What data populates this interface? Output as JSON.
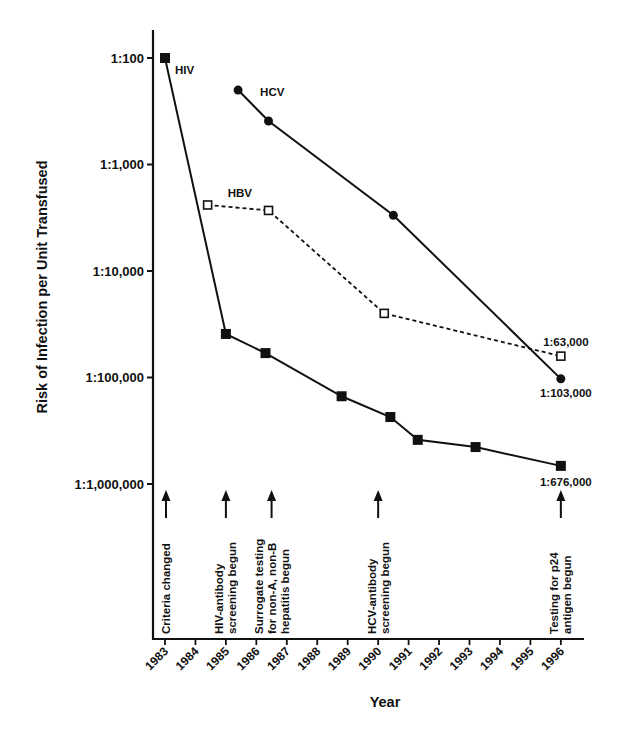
{
  "chart_data": {
    "type": "line",
    "title": "",
    "xlabel": "Year",
    "ylabel": "Risk of Infection per Unit Transfused",
    "yscale": "log",
    "ylim_denominators": [
      100,
      1000000
    ],
    "y_ticks": [
      {
        "denominator": 100,
        "label": "1:100"
      },
      {
        "denominator": 1000,
        "label": "1:1,000"
      },
      {
        "denominator": 10000,
        "label": "1:10,000"
      },
      {
        "denominator": 100000,
        "label": "1:100,000"
      },
      {
        "denominator": 1000000,
        "label": "1:1,000,000"
      }
    ],
    "x_ticks": [
      "1983",
      "1984",
      "1985",
      "1986",
      "1987",
      "1988",
      "1989",
      "1990",
      "1991",
      "1992",
      "1993",
      "1994",
      "1995",
      "1996"
    ],
    "xlim": [
      1983,
      1996
    ],
    "grid": false,
    "legend": "inline series labels",
    "series": [
      {
        "name": "HIV",
        "marker": "filled-square",
        "line": "solid",
        "points": [
          {
            "x": 1983,
            "risk_denominator": 100
          },
          {
            "x": 1985,
            "risk_denominator": 39000
          },
          {
            "x": 1986.3,
            "risk_denominator": 59000
          },
          {
            "x": 1988.8,
            "risk_denominator": 150000
          },
          {
            "x": 1990.4,
            "risk_denominator": 235000
          },
          {
            "x": 1991.3,
            "risk_denominator": 385000
          },
          {
            "x": 1993.2,
            "risk_denominator": 450000
          },
          {
            "x": 1996,
            "risk_denominator": 676000
          }
        ],
        "end_label": "1:676,000"
      },
      {
        "name": "HCV",
        "marker": "filled-circle",
        "line": "solid",
        "points": [
          {
            "x": 1985.4,
            "risk_denominator": 200
          },
          {
            "x": 1986.4,
            "risk_denominator": 390
          },
          {
            "x": 1990.5,
            "risk_denominator": 3000
          },
          {
            "x": 1996,
            "risk_denominator": 103000
          }
        ],
        "end_label": "1:103,000"
      },
      {
        "name": "HBV",
        "marker": "open-square",
        "line": "dashed",
        "points": [
          {
            "x": 1984.4,
            "risk_denominator": 2400
          },
          {
            "x": 1986.4,
            "risk_denominator": 2700
          },
          {
            "x": 1990.2,
            "risk_denominator": 25000
          },
          {
            "x": 1996,
            "risk_denominator": 63000
          }
        ],
        "end_label": "1:63,000"
      }
    ],
    "annotations": [
      {
        "x": 1983,
        "text": [
          "Criteria changed"
        ]
      },
      {
        "x": 1985,
        "text": [
          "HIV-antibody",
          "screening begun"
        ]
      },
      {
        "x": 1986.5,
        "text": [
          "Surrogate testing",
          "for non-A, non-B",
          "hepatitis begun"
        ]
      },
      {
        "x": 1990,
        "text": [
          "HCV-antibody",
          "screening begun"
        ]
      },
      {
        "x": 1996,
        "text": [
          "Testing for p24",
          "antigen begun"
        ]
      }
    ]
  },
  "colors": {
    "ink": "#111111",
    "background": "#ffffff"
  }
}
